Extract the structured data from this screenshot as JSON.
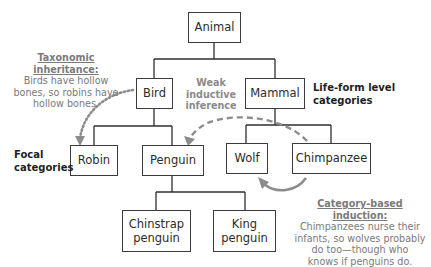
{
  "nodes": {
    "animal": "Animal",
    "bird": "Bird",
    "mammal": "Mammal",
    "robin": "Robin",
    "penguin": "Penguin",
    "wolf": "Wolf",
    "chimpanzee": "Chimpanzee",
    "chinstrap_line1": "Chinstrap",
    "chinstrap_line2": "penguin",
    "king_line1": "King",
    "king_line2": "penguin"
  },
  "level_labels": {
    "life_form_line1": "Life-form level",
    "life_form_line2": "categories",
    "focal_line1": "Focal",
    "focal_line2": "categories"
  },
  "annotations": {
    "taxonomic": {
      "heading": "Taxonomic inheritance:",
      "line1": "Birds have hollow",
      "line2": "bones, so robins have",
      "line3": "hollow bones."
    },
    "weak": {
      "line1": "Weak",
      "line2": "inductive",
      "line3": "inference"
    },
    "category_based": {
      "heading": "Category-based induction:",
      "line1": "Chimpanzees nurse their",
      "line2": "infants, so wolves probably",
      "line3": "do too—though who",
      "line4": "knows if penguins do."
    }
  },
  "colors": {
    "tree_line": "#2e2e2e",
    "arrow_gray": "#8c8c8c",
    "annotation_text": "#7a7a7a"
  }
}
